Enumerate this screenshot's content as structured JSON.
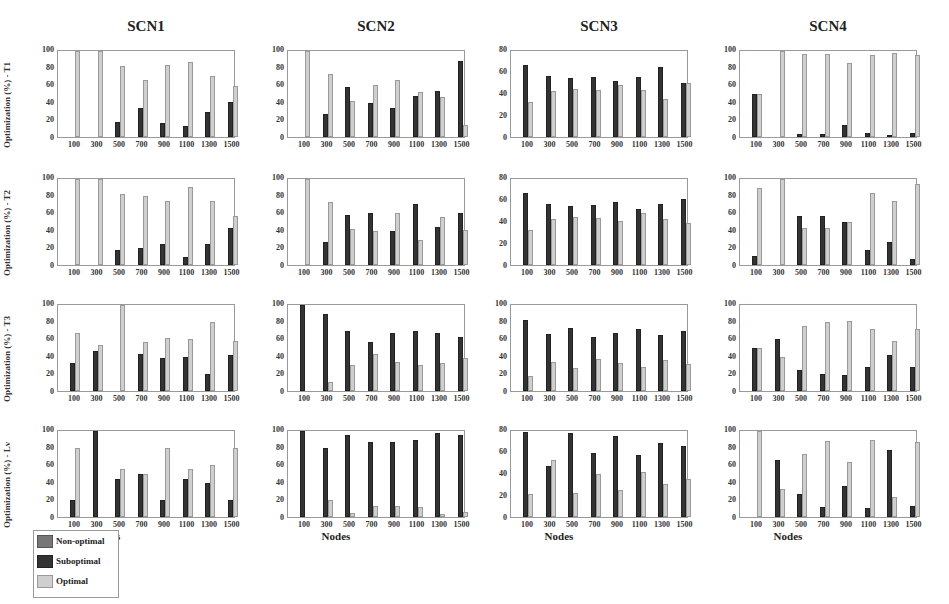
{
  "chart_data": [
    {
      "type": "bar",
      "title": "SCN1",
      "row": "T1",
      "ylabel": "Optimization (%) - T1",
      "xlabel": "",
      "ylim": [
        0,
        100
      ],
      "yticks": [
        0,
        20,
        40,
        60,
        80,
        100
      ],
      "categories": [
        "100",
        "300",
        "500",
        "700",
        "900",
        "1100",
        "1300",
        "1500"
      ],
      "series": [
        {
          "name": "Non-optimal",
          "values": [
            0,
            0,
            0,
            0,
            0,
            0,
            0,
            0
          ]
        },
        {
          "name": "Suboptimal",
          "values": [
            0,
            0,
            17,
            34,
            16,
            13,
            29,
            41
          ]
        },
        {
          "name": "Optimal",
          "values": [
            100,
            100,
            83,
            66,
            84,
            87,
            71,
            59
          ]
        }
      ]
    },
    {
      "type": "bar",
      "title": "SCN2",
      "row": "T1",
      "ylabel": "",
      "xlabel": "",
      "ylim": [
        0,
        100
      ],
      "yticks": [
        0,
        20,
        40,
        60,
        80,
        100
      ],
      "categories": [
        "100",
        "300",
        "500",
        "700",
        "900",
        "1100",
        "1300",
        "1500"
      ],
      "series": [
        {
          "name": "Non-optimal",
          "values": [
            0,
            0,
            0,
            0,
            0,
            0,
            0,
            0
          ]
        },
        {
          "name": "Suboptimal",
          "values": [
            0,
            27,
            58,
            40,
            34,
            48,
            53,
            88
          ]
        },
        {
          "name": "Optimal",
          "values": [
            100,
            73,
            42,
            60,
            66,
            52,
            47,
            14
          ]
        }
      ]
    },
    {
      "type": "bar",
      "title": "SCN3",
      "row": "T1",
      "ylabel": "",
      "xlabel": "",
      "ylim": [
        0,
        80
      ],
      "yticks": [
        0,
        20,
        40,
        60,
        80
      ],
      "categories": [
        "100",
        "300",
        "500",
        "700",
        "900",
        "1100",
        "1300",
        "1500"
      ],
      "series": [
        {
          "name": "Non-optimal",
          "values": [
            0,
            0,
            0,
            0,
            0,
            0,
            0,
            0
          ]
        },
        {
          "name": "Suboptimal",
          "values": [
            67,
            57,
            55,
            56,
            52,
            56,
            65,
            50
          ]
        },
        {
          "name": "Optimal",
          "values": [
            33,
            43,
            45,
            44,
            48,
            44,
            35,
            50
          ]
        }
      ]
    },
    {
      "type": "bar",
      "title": "SCN4",
      "row": "T1",
      "ylabel": "",
      "xlabel": "",
      "ylim": [
        0,
        100
      ],
      "yticks": [
        0,
        20,
        40,
        60,
        80,
        100
      ],
      "categories": [
        "100",
        "300",
        "500",
        "700",
        "900",
        "1100",
        "1300",
        "1500"
      ],
      "series": [
        {
          "name": "Non-optimal",
          "values": [
            0,
            0,
            0,
            0,
            0,
            0,
            0,
            0
          ]
        },
        {
          "name": "Suboptimal",
          "values": [
            50,
            0,
            4,
            3,
            14,
            5,
            2,
            5
          ]
        },
        {
          "name": "Optimal",
          "values": [
            50,
            100,
            96,
            97,
            86,
            95,
            98,
            95
          ]
        }
      ]
    },
    {
      "type": "bar",
      "title": "",
      "row": "T2",
      "ylabel": "Optimization (%) - T2",
      "xlabel": "",
      "ylim": [
        0,
        100
      ],
      "yticks": [
        0,
        20,
        40,
        60,
        80,
        100
      ],
      "categories": [
        "100",
        "300",
        "500",
        "700",
        "900",
        "1100",
        "1300",
        "1500"
      ],
      "series": [
        {
          "name": "Non-optimal",
          "values": [
            0,
            0,
            0,
            0,
            0,
            0,
            0,
            0
          ]
        },
        {
          "name": "Suboptimal",
          "values": [
            0,
            0,
            17,
            20,
            25,
            9,
            25,
            43
          ]
        },
        {
          "name": "Optimal",
          "values": [
            100,
            100,
            83,
            80,
            75,
            91,
            75,
            57
          ]
        }
      ]
    },
    {
      "type": "bar",
      "title": "",
      "row": "T2",
      "ylabel": "",
      "xlabel": "",
      "ylim": [
        0,
        100
      ],
      "yticks": [
        0,
        20,
        40,
        60,
        80,
        100
      ],
      "categories": [
        "100",
        "300",
        "500",
        "700",
        "900",
        "1100",
        "1300",
        "1500"
      ],
      "series": [
        {
          "name": "Non-optimal",
          "values": [
            0,
            0,
            0,
            0,
            0,
            0,
            0,
            0
          ]
        },
        {
          "name": "Suboptimal",
          "values": [
            0,
            27,
            58,
            60,
            39,
            71,
            44,
            60
          ]
        },
        {
          "name": "Optimal",
          "values": [
            100,
            73,
            42,
            40,
            61,
            29,
            56,
            41
          ]
        }
      ]
    },
    {
      "type": "bar",
      "title": "",
      "row": "T2",
      "ylabel": "",
      "xlabel": "",
      "ylim": [
        0,
        80
      ],
      "yticks": [
        0,
        20,
        40,
        60,
        80
      ],
      "categories": [
        "100",
        "300",
        "500",
        "700",
        "900",
        "1100",
        "1300",
        "1500"
      ],
      "series": [
        {
          "name": "Non-optimal",
          "values": [
            0,
            0,
            0,
            0,
            0,
            0,
            0,
            0
          ]
        },
        {
          "name": "Suboptimal",
          "values": [
            67,
            57,
            55,
            56,
            59,
            52,
            57,
            61
          ]
        },
        {
          "name": "Optimal",
          "values": [
            33,
            43,
            45,
            44,
            41,
            48,
            43,
            39
          ]
        }
      ]
    },
    {
      "type": "bar",
      "title": "",
      "row": "T2",
      "ylabel": "",
      "xlabel": "",
      "ylim": [
        0,
        100
      ],
      "yticks": [
        0,
        20,
        40,
        60,
        80,
        100
      ],
      "categories": [
        "100",
        "300",
        "500",
        "700",
        "900",
        "1100",
        "1300",
        "1500"
      ],
      "series": [
        {
          "name": "Non-optimal",
          "values": [
            0,
            0,
            0,
            0,
            0,
            0,
            0,
            0
          ]
        },
        {
          "name": "Suboptimal",
          "values": [
            11,
            0,
            57,
            57,
            50,
            17,
            27,
            7
          ]
        },
        {
          "name": "Optimal",
          "values": [
            89,
            100,
            43,
            43,
            50,
            84,
            74,
            94
          ]
        }
      ]
    },
    {
      "type": "bar",
      "title": "",
      "row": "T3",
      "ylabel": "Optimization (%) - T3",
      "xlabel": "",
      "ylim": [
        0,
        100
      ],
      "yticks": [
        0,
        20,
        40,
        60,
        80,
        100
      ],
      "categories": [
        "100",
        "300",
        "500",
        "700",
        "900",
        "1100",
        "1300",
        "1500"
      ],
      "series": [
        {
          "name": "Non-optimal",
          "values": [
            0,
            0,
            0,
            0,
            0,
            0,
            0,
            0
          ]
        },
        {
          "name": "Suboptimal",
          "values": [
            33,
            46,
            0,
            43,
            38,
            39,
            20,
            42
          ]
        },
        {
          "name": "Optimal",
          "values": [
            67,
            54,
            100,
            57,
            62,
            61,
            80,
            58
          ]
        }
      ]
    },
    {
      "type": "bar",
      "title": "",
      "row": "T3",
      "ylabel": "",
      "xlabel": "",
      "ylim": [
        0,
        100
      ],
      "yticks": [
        0,
        20,
        40,
        60,
        80,
        100
      ],
      "categories": [
        "100",
        "300",
        "500",
        "700",
        "900",
        "1100",
        "1300",
        "1500"
      ],
      "series": [
        {
          "name": "Non-optimal",
          "values": [
            0,
            0,
            0,
            0,
            0,
            0,
            0,
            0
          ]
        },
        {
          "name": "Suboptimal",
          "values": [
            100,
            89,
            70,
            57,
            67,
            70,
            68,
            63
          ]
        },
        {
          "name": "Optimal",
          "values": [
            0,
            11,
            30,
            43,
            34,
            30,
            33,
            38
          ]
        }
      ]
    },
    {
      "type": "bar",
      "title": "",
      "row": "T3",
      "ylabel": "",
      "xlabel": "",
      "ylim": [
        0,
        100
      ],
      "yticks": [
        0,
        20,
        40,
        60,
        80,
        100
      ],
      "categories": [
        "100",
        "300",
        "500",
        "700",
        "900",
        "1100",
        "1300",
        "1500"
      ],
      "series": [
        {
          "name": "Non-optimal",
          "values": [
            0,
            0,
            0,
            0,
            0,
            0,
            0,
            0
          ]
        },
        {
          "name": "Suboptimal",
          "values": [
            82,
            66,
            73,
            63,
            67,
            72,
            65,
            70
          ]
        },
        {
          "name": "Optimal",
          "values": [
            18,
            34,
            27,
            37,
            33,
            28,
            36,
            31
          ]
        }
      ]
    },
    {
      "type": "bar",
      "title": "",
      "row": "T3",
      "ylabel": "",
      "xlabel": "",
      "ylim": [
        0,
        100
      ],
      "yticks": [
        0,
        20,
        40,
        60,
        80,
        100
      ],
      "categories": [
        "100",
        "300",
        "500",
        "700",
        "900",
        "1100",
        "1300",
        "1500"
      ],
      "series": [
        {
          "name": "Non-optimal",
          "values": [
            0,
            0,
            0,
            0,
            0,
            0,
            0,
            0
          ]
        },
        {
          "name": "Suboptimal",
          "values": [
            50,
            60,
            25,
            20,
            19,
            28,
            42,
            28
          ]
        },
        {
          "name": "Optimal",
          "values": [
            50,
            40,
            76,
            80,
            81,
            72,
            58,
            72
          ]
        }
      ]
    },
    {
      "type": "bar",
      "title": "",
      "row": "Lv",
      "ylabel": "Optimization (%) - Lv",
      "xlabel": "Nodes",
      "ylim": [
        0,
        100
      ],
      "yticks": [
        0,
        20,
        40,
        60,
        80,
        100
      ],
      "categories": [
        "100",
        "300",
        "500",
        "700",
        "900",
        "1100",
        "1300",
        "1500"
      ],
      "series": [
        {
          "name": "Non-optimal",
          "values": [
            0,
            0,
            0,
            0,
            0,
            0,
            0,
            0
          ]
        },
        {
          "name": "Suboptimal",
          "values": [
            20,
            100,
            44,
            50,
            20,
            44,
            39,
            20
          ]
        },
        {
          "name": "Optimal",
          "values": [
            80,
            0,
            56,
            50,
            80,
            56,
            61,
            80
          ]
        }
      ]
    },
    {
      "type": "bar",
      "title": "",
      "row": "Lv",
      "ylabel": "",
      "xlabel": "Nodes",
      "ylim": [
        0,
        100
      ],
      "yticks": [
        0,
        20,
        40,
        60,
        80,
        100
      ],
      "categories": [
        "100",
        "300",
        "500",
        "700",
        "900",
        "1100",
        "1300",
        "1500"
      ],
      "series": [
        {
          "name": "Non-optimal",
          "values": [
            0,
            0,
            0,
            0,
            0,
            0,
            0,
            0
          ]
        },
        {
          "name": "Suboptimal",
          "values": [
            100,
            80,
            95,
            87,
            87,
            89,
            98,
            95
          ]
        },
        {
          "name": "Optimal",
          "values": [
            0,
            20,
            5,
            13,
            13,
            12,
            3,
            6
          ]
        }
      ]
    },
    {
      "type": "bar",
      "title": "",
      "row": "Lv",
      "ylabel": "",
      "xlabel": "Nodes",
      "ylim": [
        0,
        80
      ],
      "yticks": [
        0,
        20,
        40,
        60,
        80
      ],
      "categories": [
        "100",
        "300",
        "500",
        "700",
        "900",
        "1100",
        "1300",
        "1500"
      ],
      "series": [
        {
          "name": "Non-optimal",
          "values": [
            0,
            0,
            0,
            0,
            0,
            0,
            0,
            0
          ]
        },
        {
          "name": "Suboptimal",
          "values": [
            79,
            47,
            78,
            60,
            75,
            58,
            69,
            66
          ]
        },
        {
          "name": "Optimal",
          "values": [
            21,
            53,
            22,
            40,
            25,
            42,
            31,
            35
          ]
        }
      ]
    },
    {
      "type": "bar",
      "title": "",
      "row": "Lv",
      "ylabel": "",
      "xlabel": "Nodes",
      "ylim": [
        0,
        100
      ],
      "yticks": [
        0,
        20,
        40,
        60,
        80,
        100
      ],
      "categories": [
        "100",
        "300",
        "500",
        "700",
        "900",
        "1100",
        "1300",
        "1500"
      ],
      "series": [
        {
          "name": "Non-optimal",
          "values": [
            0,
            0,
            0,
            0,
            0,
            0,
            0,
            0
          ]
        },
        {
          "name": "Suboptimal",
          "values": [
            0,
            66,
            27,
            12,
            36,
            11,
            78,
            13
          ]
        },
        {
          "name": "Optimal",
          "values": [
            100,
            33,
            73,
            88,
            64,
            89,
            23,
            87
          ]
        }
      ]
    }
  ],
  "column_titles": [
    "SCN1",
    "SCN2",
    "SCN3",
    "SCN4"
  ],
  "row_labels": [
    "Optimization (%) - T1",
    "Optimization (%) - T2",
    "Optimization (%) - T3",
    "Optimization (%) - Lv"
  ],
  "xlabel": "Nodes",
  "legend": {
    "position": "bottom-left",
    "items": [
      {
        "label": "Non-optimal",
        "color": "#777777"
      },
      {
        "label": "Suboptimal",
        "color": "#333333"
      },
      {
        "label": "Optimal",
        "color": "#cfcfcf"
      }
    ]
  },
  "colors": {
    "suboptimal": "#333333",
    "optimal": "#cfcfcf",
    "non_optimal": "#777777",
    "axis": "#9a9a9a"
  }
}
